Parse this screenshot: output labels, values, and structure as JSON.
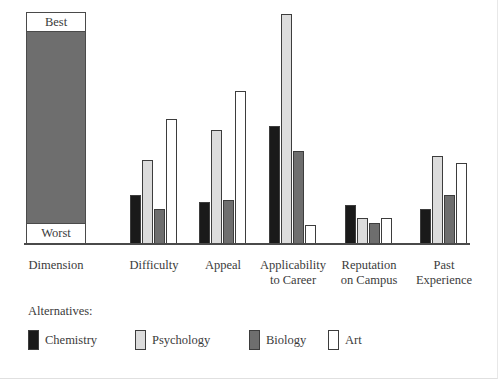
{
  "chart_data": {
    "type": "bar",
    "title": "",
    "subtitle": "",
    "xlabel": "",
    "ylabel": "",
    "scale_top_label": "Best",
    "scale_bottom_label": "Worst",
    "reference_axis_label": "Dimension",
    "ylim": [
      0,
      100
    ],
    "grid": false,
    "legend_position": "bottom-left",
    "legend_title": "Alternatives:",
    "categories": [
      "Difficulty",
      "Appeal",
      "Applicability\nto Career",
      "Reputation\non Campus",
      "Past\nExperience"
    ],
    "series": [
      {
        "name": "Chemistry",
        "color": "#1a1a1a",
        "values": [
          21,
          18,
          51,
          17,
          15
        ]
      },
      {
        "name": "Psychology",
        "color": "#dcdcdc",
        "values": [
          36,
          49,
          99,
          11,
          38
        ]
      },
      {
        "name": "Biology",
        "color": "#6e6e6e",
        "values": [
          15,
          19,
          40,
          9,
          21
        ]
      },
      {
        "name": "Art",
        "color": "#ffffff",
        "values": [
          54,
          66,
          8,
          11,
          35
        ]
      }
    ]
  },
  "axis": {
    "baseline_color": "#4a4a4a",
    "bar_border_color": "#3d3d3d"
  }
}
